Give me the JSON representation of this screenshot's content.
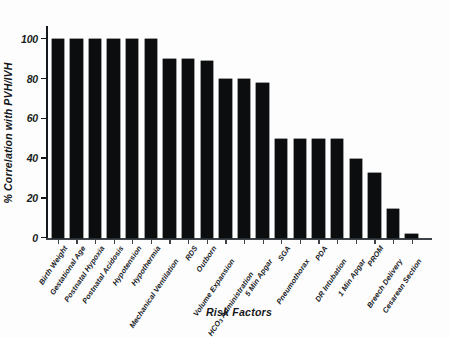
{
  "chart_data": {
    "type": "bar",
    "title": "",
    "xlabel": "Risk Factors",
    "ylabel": "% Correlation with PVH/IVH",
    "ylim": [
      0,
      100
    ],
    "yticks": [
      0,
      20,
      40,
      60,
      80,
      100
    ],
    "ytick_labels": [
      "0",
      "20",
      "40",
      "60",
      "80",
      "100"
    ],
    "grid": false,
    "legend": null,
    "bar_color": "#0c0d0f",
    "categories": [
      "Birth Weight",
      "Gestational Age",
      "Postnatal Hypoxia",
      "Postnatal Acidosis",
      "Hypotension",
      "Hypothermia",
      "Mechanical Ventilation",
      "RDS",
      "Outborn",
      "Volume Expansion",
      "HCO3 Administration",
      "5 Min Apgar",
      "SGA",
      "Pneumothorax",
      "PDA",
      "DR Intubation",
      "1 Min Apgar",
      "PROM",
      "Breech Delivery",
      "Cesarean Section"
    ],
    "values": [
      100,
      100,
      100,
      100,
      100,
      100,
      90,
      89,
      80,
      80,
      78,
      50,
      50,
      50,
      50,
      40,
      33,
      15,
      2,
      2
    ]
  },
  "bars": [
    {
      "label": "Birth Weight",
      "label_html": "Birth Weight",
      "value": 100,
      "row": "upper"
    },
    {
      "label": "Gestational Age",
      "label_html": "Gestational Age",
      "value": 100,
      "row": "upper"
    },
    {
      "label": "Postnatal Hypoxia",
      "label_html": "Postnatal Hypoxia",
      "value": 100,
      "row": "upper"
    },
    {
      "label": "Postnatal Acidosis",
      "label_html": "Postnatal Acidosis",
      "value": 100,
      "row": "upper"
    },
    {
      "label": "Hypotension",
      "label_html": "Hypotension",
      "value": 100,
      "row": "upper"
    },
    {
      "label": "Hypothermia",
      "label_html": "Hypothermia",
      "value": 100,
      "row": "upper"
    },
    {
      "label": "Mechanical Ventilation",
      "label_html": "Mechanical Ventilation",
      "value": 90,
      "row": "lower"
    },
    {
      "label": "RDS",
      "label_html": "RDS",
      "value": 90,
      "row": "upper"
    },
    {
      "label": "Outborn",
      "label_html": "Outborn",
      "value": 89,
      "row": "upper"
    },
    {
      "label": "Volume Expansion",
      "label_html": "Volume Expansion",
      "value": 80,
      "row": "lower"
    },
    {
      "label": "HCO3 Administration",
      "label_html": "HCO<sub>3</sub> Administration",
      "value": 80,
      "row": "lower2"
    },
    {
      "label": "5 Min Apgar",
      "label_html": "5 Min Apgar",
      "value": 78,
      "row": "lower"
    },
    {
      "label": "SGA",
      "label_html": "SGA",
      "value": 50,
      "row": "upper"
    },
    {
      "label": "Pneumothorax",
      "label_html": "Pneumothorax",
      "value": 50,
      "row": "lower"
    },
    {
      "label": "PDA",
      "label_html": "PDA",
      "value": 50,
      "row": "upper"
    },
    {
      "label": "DR Intubation",
      "label_html": "DR Intubation",
      "value": 50,
      "row": "lower"
    },
    {
      "label": "1 Min Apgar",
      "label_html": "1 Min Apgar",
      "value": 40,
      "row": "lower"
    },
    {
      "label": "PROM",
      "label_html": "PROM",
      "value": 33,
      "row": "upper"
    },
    {
      "label": "Breech Delivery",
      "label_html": "Breech Delivery",
      "value": 15,
      "row": "lower"
    },
    {
      "label": "Cesarean Section",
      "label_html": "Cesarean Section",
      "value": 2,
      "row": "lower"
    }
  ]
}
